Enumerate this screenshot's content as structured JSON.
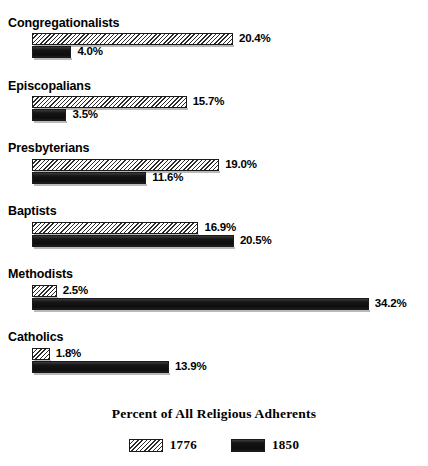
{
  "chart_data": {
    "type": "bar",
    "orientation": "horizontal",
    "title": "Percent of All Religious Adherents",
    "xlabel": "",
    "ylabel": "",
    "grid": false,
    "legend_position": "bottom",
    "value_suffix": "%",
    "xlim": [
      0,
      34.2
    ],
    "px_per_unit": 9.85,
    "categories": [
      "Congregationalists",
      "Episcopalians",
      "Presbyterians",
      "Baptists",
      "Methodists",
      "Catholics"
    ],
    "series": [
      {
        "name": "1776",
        "pattern": "hatch",
        "values": [
          20.4,
          15.7,
          19.0,
          16.9,
          2.5,
          1.8
        ],
        "labels": [
          "20.4%",
          "15.7%",
          "19.0%",
          "16.9%",
          "2.5%",
          "1.8%"
        ]
      },
      {
        "name": "1850",
        "pattern": "solid",
        "values": [
          4.0,
          3.5,
          11.6,
          20.5,
          34.2,
          13.9
        ],
        "labels": [
          "4.0%",
          "3.5%",
          "11.6%",
          "20.5%",
          "34.2%",
          "13.9%"
        ]
      }
    ],
    "colors": {
      "hatch_line": "#2b2b2b",
      "hatch_fill": "#ffffff",
      "solid_fill": "#161616",
      "outline": "#1a1a1a",
      "text": "#000000",
      "background": "#ffffff"
    }
  },
  "groups": [
    {
      "label": "Congregationalists",
      "top": 16,
      "bars": [
        {
          "series": "1776",
          "value": 20.4,
          "label": "20.4%",
          "top": 33
        },
        {
          "series": "1850",
          "value": 4.0,
          "label": "4.0%",
          "top": 46
        }
      ]
    },
    {
      "label": "Episcopalians",
      "top": 79,
      "bars": [
        {
          "series": "1776",
          "value": 15.7,
          "label": "15.7%",
          "top": 96
        },
        {
          "series": "1850",
          "value": 3.5,
          "label": "3.5%",
          "top": 109
        }
      ]
    },
    {
      "label": "Presbyterians",
      "top": 141,
      "bars": [
        {
          "series": "1776",
          "value": 19.0,
          "label": "19.0%",
          "top": 159
        },
        {
          "series": "1850",
          "value": 11.6,
          "label": "11.6%",
          "top": 172
        }
      ]
    },
    {
      "label": "Baptists",
      "top": 204,
      "bars": [
        {
          "series": "1776",
          "value": 16.9,
          "label": "16.9%",
          "top": 222
        },
        {
          "series": "1850",
          "value": 20.5,
          "label": "20.5%",
          "top": 235
        }
      ]
    },
    {
      "label": "Methodists",
      "top": 267,
      "bars": [
        {
          "series": "1776",
          "value": 2.5,
          "label": "2.5%",
          "top": 285
        },
        {
          "series": "1850",
          "value": 34.2,
          "label": "34.2%",
          "top": 298
        }
      ]
    },
    {
      "label": "Catholics",
      "top": 330,
      "bars": [
        {
          "series": "1776",
          "value": 1.8,
          "label": "1.8%",
          "top": 348
        },
        {
          "series": "1850",
          "value": 13.9,
          "label": "13.9%",
          "top": 361
        }
      ]
    }
  ],
  "legend": {
    "items": [
      {
        "label": "1776",
        "pattern": "hatch"
      },
      {
        "label": "1850",
        "pattern": "solid"
      }
    ]
  },
  "ghost_text": ""
}
